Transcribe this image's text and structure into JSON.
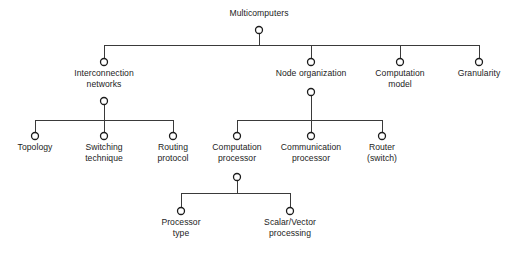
{
  "diagram": {
    "type": "hierarchy-tree",
    "title": "Multicomputers",
    "background_color": "#ffffff",
    "line_color": "#3a3a3a",
    "node_stroke_color": "#1c1c1c",
    "text_color": "#1c1c1c",
    "nodes": [
      {
        "id": "multicomputers",
        "label_lines": [
          "Multicomputers"
        ],
        "level": 0,
        "cx": 259,
        "cy": 30,
        "label_x": 259,
        "label_y": 8,
        "label_position": "above"
      },
      {
        "id": "interconnection-networks",
        "label_lines": [
          "Interconnection",
          "networks"
        ],
        "level": 1,
        "cx": 104,
        "cy": 62,
        "label_x": 104,
        "label_y": 68,
        "label_position": "below"
      },
      {
        "id": "node-organization",
        "label_lines": [
          "Node organization"
        ],
        "level": 1,
        "cx": 311,
        "cy": 62,
        "label_x": 311,
        "label_y": 68,
        "label_position": "below"
      },
      {
        "id": "computation-model",
        "label_lines": [
          "Computation",
          "model"
        ],
        "level": 1,
        "cx": 400,
        "cy": 62,
        "label_x": 400,
        "label_y": 68,
        "label_position": "below"
      },
      {
        "id": "granularity",
        "label_lines": [
          "Granularity"
        ],
        "level": 1,
        "cx": 479,
        "cy": 62,
        "label_x": 479,
        "label_y": 68,
        "label_position": "below"
      },
      {
        "id": "interconnection-networks-hub",
        "label_lines": [],
        "level": 2,
        "cx": 104,
        "cy": 101,
        "label_x": 104,
        "label_y": 0,
        "label_position": "none"
      },
      {
        "id": "node-organization-hub",
        "label_lines": [],
        "level": 2,
        "cx": 311,
        "cy": 92,
        "label_x": 311,
        "label_y": 0,
        "label_position": "none"
      },
      {
        "id": "topology",
        "label_lines": [
          "Topology"
        ],
        "level": 3,
        "cx": 35,
        "cy": 136,
        "label_x": 35,
        "label_y": 142,
        "label_position": "below"
      },
      {
        "id": "switching-technique",
        "label_lines": [
          "Switching",
          "technique"
        ],
        "level": 3,
        "cx": 104,
        "cy": 136,
        "label_x": 104,
        "label_y": 142,
        "label_position": "below"
      },
      {
        "id": "routing-protocol",
        "label_lines": [
          "Routing",
          "protocol"
        ],
        "level": 3,
        "cx": 173,
        "cy": 136,
        "label_x": 173,
        "label_y": 142,
        "label_position": "below"
      },
      {
        "id": "computation-processor",
        "label_lines": [
          "Computation",
          "processor"
        ],
        "level": 3,
        "cx": 237,
        "cy": 136,
        "label_x": 237,
        "label_y": 142,
        "label_position": "below"
      },
      {
        "id": "communication-processor",
        "label_lines": [
          "Communication",
          "processor"
        ],
        "level": 3,
        "cx": 311,
        "cy": 136,
        "label_x": 311,
        "label_y": 142,
        "label_position": "below"
      },
      {
        "id": "router-switch",
        "label_lines": [
          "Router",
          "(switch)"
        ],
        "level": 3,
        "cx": 382,
        "cy": 136,
        "label_x": 382,
        "label_y": 142,
        "label_position": "below"
      },
      {
        "id": "computation-processor-hub",
        "label_lines": [],
        "level": 4,
        "cx": 237,
        "cy": 177,
        "label_x": 237,
        "label_y": 0,
        "label_position": "none"
      },
      {
        "id": "processor-type",
        "label_lines": [
          "Processor",
          "type"
        ],
        "level": 5,
        "cx": 181,
        "cy": 211,
        "label_x": 181,
        "label_y": 217,
        "label_position": "below"
      },
      {
        "id": "scalar-vector-processing",
        "label_lines": [
          "Scalar/Vector",
          "processing"
        ],
        "level": 5,
        "cx": 290,
        "cy": 211,
        "label_x": 290,
        "label_y": 217,
        "label_position": "below"
      }
    ],
    "connectors": [
      {
        "id": "root-stem",
        "type": "vertical",
        "x": 259,
        "y1": 34,
        "y2": 45
      },
      {
        "id": "level1-bus",
        "type": "horizontal",
        "y": 45,
        "x1": 104,
        "x2": 479
      },
      {
        "id": "drop-interconnection",
        "type": "vertical",
        "x": 104,
        "y1": 45,
        "y2": 58
      },
      {
        "id": "drop-node-organization",
        "type": "vertical",
        "x": 311,
        "y1": 45,
        "y2": 58
      },
      {
        "id": "drop-computation-model",
        "type": "vertical",
        "x": 400,
        "y1": 45,
        "y2": 58
      },
      {
        "id": "drop-granularity",
        "type": "vertical",
        "x": 479,
        "y1": 45,
        "y2": 58
      },
      {
        "id": "interconnection-hub-stem",
        "type": "vertical",
        "x": 104,
        "y1": 105,
        "y2": 120
      },
      {
        "id": "interconnection-bus",
        "type": "horizontal",
        "y": 120,
        "x1": 35,
        "x2": 173
      },
      {
        "id": "drop-topology",
        "type": "vertical",
        "x": 35,
        "y1": 120,
        "y2": 132
      },
      {
        "id": "drop-switching",
        "type": "vertical",
        "x": 104,
        "y1": 120,
        "y2": 132
      },
      {
        "id": "drop-routing",
        "type": "vertical",
        "x": 173,
        "y1": 120,
        "y2": 132
      },
      {
        "id": "node-org-hub-stem",
        "type": "vertical",
        "x": 311,
        "y1": 96,
        "y2": 120
      },
      {
        "id": "node-org-bus",
        "type": "horizontal",
        "y": 120,
        "x1": 237,
        "x2": 382
      },
      {
        "id": "drop-computation-processor",
        "type": "vertical",
        "x": 237,
        "y1": 120,
        "y2": 132
      },
      {
        "id": "drop-communication-processor",
        "type": "vertical",
        "x": 311,
        "y1": 120,
        "y2": 132
      },
      {
        "id": "drop-router",
        "type": "vertical",
        "x": 382,
        "y1": 120,
        "y2": 132
      },
      {
        "id": "computation-processor-hub-stem",
        "type": "vertical",
        "x": 237,
        "y1": 181,
        "y2": 193
      },
      {
        "id": "computation-processor-bus",
        "type": "horizontal",
        "y": 193,
        "x1": 181,
        "x2": 290
      },
      {
        "id": "drop-processor-type",
        "type": "vertical",
        "x": 181,
        "y1": 193,
        "y2": 207
      },
      {
        "id": "drop-scalar-vector",
        "type": "vertical",
        "x": 290,
        "y1": 193,
        "y2": 207
      }
    ]
  }
}
